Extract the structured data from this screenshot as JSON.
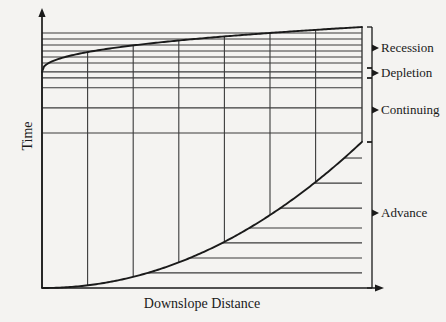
{
  "figure": {
    "type": "schematic-diagram",
    "axes": {
      "y_label": "Time",
      "x_label": "Downslope Distance",
      "y_axis_arrow": true,
      "x_axis_arrow": true,
      "origin_px": [
        42,
        288
      ],
      "plot_right_px": 362,
      "plot_top_px": 27
    },
    "phase_labels": [
      {
        "id": "recession",
        "label": "Recession",
        "bracket_top_px": 27,
        "bracket_bottom_px": 68,
        "tick_y_px": 48
      },
      {
        "id": "depletion",
        "label": "Depletion",
        "bracket_top_px": 68,
        "bracket_bottom_px": 78,
        "tick_y_px": 73
      },
      {
        "id": "continuing",
        "label": "Continuing",
        "bracket_top_px": 78,
        "bracket_bottom_px": 142,
        "tick_y_px": 110
      },
      {
        "id": "advance",
        "label": "Advance",
        "bracket_top_px": 142,
        "bracket_bottom_px": 288,
        "tick_y_px": 213
      }
    ]
  },
  "chart_data": {
    "type": "line",
    "title": "",
    "xlabel": "Downslope Distance",
    "ylabel": "Time",
    "xlim": [
      0,
      1
    ],
    "ylim": [
      0,
      1
    ],
    "grid": true,
    "legend": "none",
    "series": [
      {
        "name": "Advance curve",
        "note": "lower boundary; time of water front arrival vs downslope distance",
        "x": [
          0.0,
          0.1,
          0.2,
          0.3,
          0.4,
          0.5,
          0.6,
          0.7,
          0.8,
          0.9,
          0.95,
          1.0
        ],
        "y": [
          0.0,
          0.055,
          0.115,
          0.18,
          0.25,
          0.325,
          0.405,
          0.49,
          0.58,
          0.45,
          0.52,
          0.56
        ]
      },
      {
        "name": "Recession curve",
        "note": "upper boundary; time of water disappearance vs downslope distance",
        "x": [
          0.0,
          0.1,
          0.2,
          0.3,
          0.4,
          0.5,
          0.6,
          0.7,
          0.8,
          0.9,
          1.0
        ],
        "y": [
          0.828,
          0.872,
          0.9,
          0.921,
          0.938,
          0.952,
          0.964,
          0.974,
          0.983,
          0.992,
          1.0
        ]
      }
    ],
    "vertical_gridlines_x": [
      0.0,
      0.1425,
      0.285,
      0.4275,
      0.57,
      0.7125,
      0.855,
      1.0
    ],
    "horizontal_gridlines_y": [
      0.058,
      0.115,
      0.173,
      0.23,
      0.306,
      0.402,
      0.498,
      0.594,
      0.69,
      0.767,
      0.805,
      0.828,
      0.862,
      0.885,
      0.908,
      0.931,
      0.954,
      0.977
    ],
    "annotations": [
      "Recession",
      "Depletion",
      "Continuing",
      "Advance"
    ]
  },
  "colors": {
    "ink": "#1a1a1a",
    "grid": "#3a3a3a",
    "background": "#f4f3f1"
  }
}
